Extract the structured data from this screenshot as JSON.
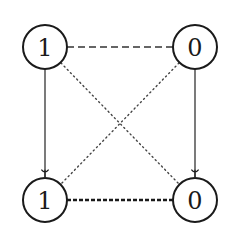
{
  "diagram": {
    "nodes": [
      {
        "id": "top-left",
        "label": "1",
        "cx": 45,
        "cy": 47
      },
      {
        "id": "top-right",
        "label": "0",
        "cx": 195,
        "cy": 47
      },
      {
        "id": "bottom-left",
        "label": "1",
        "cx": 45,
        "cy": 200
      },
      {
        "id": "bottom-right",
        "label": "0",
        "cx": 195,
        "cy": 200
      }
    ],
    "node_radius": 22,
    "edges": [
      {
        "from": "top-left",
        "to": "top-right",
        "style": "dashed",
        "directed": false
      },
      {
        "from": "bottom-left",
        "to": "bottom-right",
        "style": "densely-dashed-thick",
        "directed": false
      },
      {
        "from": "top-left",
        "to": "bottom-left",
        "style": "solid",
        "directed": true
      },
      {
        "from": "top-right",
        "to": "bottom-right",
        "style": "solid",
        "directed": true
      },
      {
        "from": "top-left",
        "to": "bottom-right",
        "style": "dotted",
        "directed": false
      },
      {
        "from": "top-right",
        "to": "bottom-left",
        "style": "dotted",
        "directed": false
      }
    ],
    "colors": {
      "stroke": "#1a1a1a",
      "background": "#ffffff"
    }
  }
}
